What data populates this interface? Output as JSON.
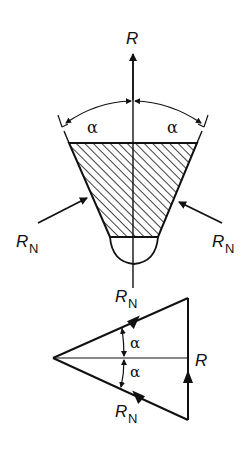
{
  "diagram": {
    "colors": {
      "ink": "#111111",
      "background": "#ffffff"
    },
    "labels": {
      "resultant_top": "R",
      "angle_left": "α",
      "angle_right": "α",
      "normal_left_main": "R",
      "normal_left_sub": "N",
      "normal_right_main": "R",
      "normal_right_sub": "N",
      "normal_bottom_main": "R",
      "normal_bottom_sub": "N",
      "triangle_top_main": "R",
      "triangle_top_sub": "N",
      "triangle_angle_upper": "α",
      "triangle_angle_lower": "α",
      "triangle_resultant": "R",
      "triangle_bottom_main": "R",
      "triangle_bottom_sub": "N"
    }
  }
}
